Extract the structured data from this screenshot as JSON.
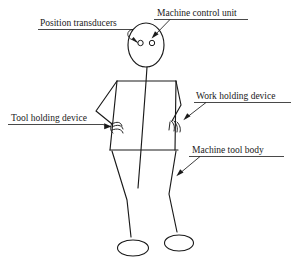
{
  "diagram": {
    "background_color": "#ffffff",
    "line_color": "#1a1a1a",
    "labels": [
      {
        "id": "position-transducers",
        "text": "Position transducers",
        "text_x": 40,
        "text_y": 26,
        "underline_x1": 38,
        "underline_x2": 133,
        "underline_y": 29,
        "points_to": "eyes"
      },
      {
        "id": "machine-control-unit",
        "text": "Machine control unit",
        "text_x": 157,
        "text_y": 16,
        "underline_x1": 154,
        "underline_x2": 248,
        "underline_y": 19,
        "points_to": "head"
      },
      {
        "id": "work-holding-device",
        "text": "Work holding device",
        "text_x": 196,
        "text_y": 99,
        "underline_x1": 194,
        "underline_x2": 290,
        "underline_y": 102,
        "points_to": "right-hand"
      },
      {
        "id": "tool-holding-device",
        "text": "Tool holding device",
        "text_x": 11,
        "text_y": 121,
        "underline_x1": 8,
        "underline_x2": 103,
        "underline_y": 124,
        "points_to": "left-hand"
      },
      {
        "id": "machine-tool-body",
        "text": "Machine tool body",
        "text_x": 192,
        "text_y": 153,
        "underline_x1": 189,
        "underline_x2": 283,
        "underline_y": 156,
        "points_to": "torso-leg"
      }
    ],
    "figure": {
      "head": {
        "cx": 146,
        "cy": 45,
        "rx": 18,
        "ry": 22
      },
      "eyes": [
        {
          "cx": 140,
          "cy": 43,
          "r": 2.6
        },
        {
          "cx": 152,
          "cy": 43,
          "r": 2.6
        }
      ],
      "spine": "M 146 67 L 138 187",
      "shoulders": "M 111 150 L 118 81 L 176 81 L 172 150",
      "left_arm": "M 118 81 L 97 110 L 114 124",
      "right_arm": "M 176 81 L 180 106 L 172 122",
      "hips": "M 111 150 L 178 150",
      "left_leg": "M 114 152 L 126 201 L 131 238",
      "right_leg": "M 174 152 L 169 196 L 176 234",
      "feet": [
        {
          "cx": 133,
          "cy": 248,
          "rx": 15,
          "ry": 8
        },
        {
          "cx": 178,
          "cy": 243,
          "rx": 14,
          "ry": 8
        }
      ]
    }
  }
}
